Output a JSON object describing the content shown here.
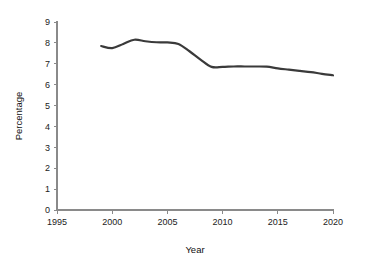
{
  "chart_data": {
    "type": "line",
    "title": "",
    "subtitle": "",
    "xlabel": "Year",
    "ylabel": "Percentage",
    "xlim": [
      1995,
      2020
    ],
    "ylim": [
      0,
      9
    ],
    "grid": false,
    "legend": "none",
    "x_ticks": [
      "1995",
      "2000",
      "2005",
      "2010",
      "2015",
      "2020"
    ],
    "x_tick_values": [
      1995,
      2000,
      2005,
      2010,
      2015,
      2020
    ],
    "y_ticks": [
      "0",
      "1",
      "2",
      "3",
      "4",
      "5",
      "6",
      "7",
      "8",
      "9"
    ],
    "y_tick_values": [
      0,
      1,
      2,
      3,
      4,
      5,
      6,
      7,
      8,
      9
    ],
    "line_color": "#3a3a3a",
    "line_width": 2.2,
    "series": [
      {
        "name": "Percentage",
        "x": [
          1999,
          2000,
          2001,
          2002,
          2003,
          2004,
          2005,
          2006,
          2007,
          2008,
          2009,
          2010,
          2011,
          2012,
          2013,
          2014,
          2015,
          2016,
          2017,
          2018,
          2019,
          2020
        ],
        "values": [
          7.85,
          7.75,
          7.95,
          8.15,
          8.08,
          8.03,
          8.02,
          7.95,
          7.6,
          7.2,
          6.85,
          6.85,
          6.87,
          6.87,
          6.87,
          6.86,
          6.78,
          6.72,
          6.66,
          6.6,
          6.52,
          6.45
        ]
      }
    ]
  },
  "axes": {
    "x_title": "Year",
    "y_title": "Percentage"
  }
}
